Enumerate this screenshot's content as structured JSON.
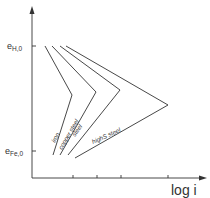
{
  "diagram": {
    "y_axis": {
      "labels": [
        {
          "main": "e",
          "sub": "H,0",
          "y": 46
        },
        {
          "main": "e",
          "sub": "Fe,0",
          "y": 151
        }
      ]
    },
    "x_axis": {
      "label": "log i",
      "ticks_x": [
        73,
        97,
        121,
        168
      ]
    },
    "curves": [
      {
        "name": "iron",
        "label": "iron",
        "points": [
          [
            45,
            46
          ],
          [
            72,
            95
          ],
          [
            53,
            155
          ]
        ],
        "label_pos": [
          55,
          143
        ],
        "label_angle": -62
      },
      {
        "name": "copper steel",
        "label": "copper steel",
        "points": [
          [
            52,
            46
          ],
          [
            96,
            92
          ],
          [
            60,
            155
          ]
        ],
        "label_pos": [
          62,
          150
        ],
        "label_angle": -60
      },
      {
        "name": "steel",
        "label": "steel",
        "points": [
          [
            60,
            46
          ],
          [
            120,
            90
          ],
          [
            68,
            155
          ]
        ],
        "label_pos": [
          75,
          137
        ],
        "label_angle": -55
      },
      {
        "name": "highS steel",
        "label": "highS steel",
        "points": [
          [
            66,
            46
          ],
          [
            168,
            105
          ],
          [
            75,
            158
          ]
        ],
        "label_pos": [
          93,
          144
        ],
        "label_angle": -24
      }
    ]
  },
  "chart_data": {
    "type": "line",
    "title": "",
    "xlabel": "log i",
    "ylabel": "",
    "y_labels": [
      "e_H,0",
      "e_Fe,0"
    ],
    "series": [
      {
        "name": "iron",
        "description": "cathodic from e_H,0 and anodic from e_Fe,0 intersect at smallest log i"
      },
      {
        "name": "copper steel"
      },
      {
        "name": "steel"
      },
      {
        "name": "highS steel",
        "description": "intersection at largest log i"
      }
    ],
    "grid": false,
    "legend": "inline labels along lines"
  }
}
